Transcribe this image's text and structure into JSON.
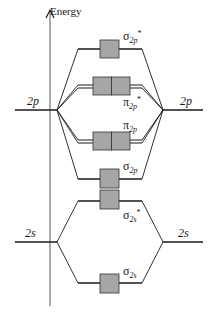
{
  "axis": {
    "label": "Energy"
  },
  "atomic_orbitals": {
    "left_2p": "2p",
    "right_2p": "2p",
    "left_2s": "2s",
    "right_2s": "2s"
  },
  "molecular_orbitals": [
    {
      "id": "sigma2p_star",
      "symbol": "σ",
      "sub": "2p",
      "sup": "*",
      "electrons": 0,
      "degenerate": 1
    },
    {
      "id": "pi2p_star",
      "symbol": "π",
      "sub": "2p",
      "sup": "*",
      "electrons": 0,
      "degenerate": 2
    },
    {
      "id": "pi2p",
      "symbol": "π",
      "sub": "2p",
      "sup": "",
      "electrons": 0,
      "degenerate": 2
    },
    {
      "id": "sigma2p",
      "symbol": "σ",
      "sub": "2p",
      "sup": "",
      "electrons": 0,
      "degenerate": 1
    },
    {
      "id": "sigma2s_star",
      "symbol": "σ",
      "sub": "2s",
      "sup": "*",
      "electrons": 0,
      "degenerate": 1
    },
    {
      "id": "sigma2s",
      "symbol": "σ",
      "sub": "2s",
      "sup": "",
      "electrons": 0,
      "degenerate": 1
    }
  ],
  "colors": {
    "box_fill": "#a6a6a6",
    "line": "#1a1a1a",
    "box_stroke": "#333333"
  }
}
